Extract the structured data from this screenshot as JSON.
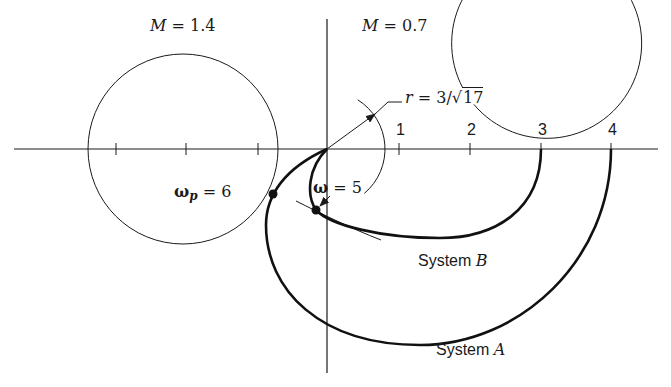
{
  "figure": {
    "width": 671,
    "height": 387,
    "ink_color": "#1a1a1a",
    "background": "#ffffff",
    "origin_px": [
      327,
      149
    ],
    "px_per_unit": 71
  },
  "axes": {
    "real_axis": {
      "x1": 14,
      "x2": 658,
      "y": 149
    },
    "imag_axis": {
      "x": 327,
      "y1": 19,
      "y2": 373
    },
    "ticks_negative_px": [
      116,
      186,
      258
    ],
    "ticks_positive": [
      {
        "label": "1",
        "x": 399
      },
      {
        "label": "2",
        "x": 470
      },
      {
        "label": "3",
        "x": 541
      },
      {
        "label": "4",
        "x": 611
      }
    ]
  },
  "m_circles": [
    {
      "name": "M = 1.4",
      "label_M": "M",
      "label_eq": " = ",
      "label_val": "1.4",
      "cx": 183,
      "cy": 149,
      "r": 95,
      "label_x": 150,
      "label_y": 18
    },
    {
      "name": "M = 0.7",
      "label_M": "M",
      "label_eq": " = ",
      "label_val": "0.7",
      "cx": 390,
      "cy": 149,
      "r": 95,
      "label_x": 362,
      "label_y": 18
    }
  ],
  "radius_annotation": {
    "prefix": "r",
    "eq": " = ",
    "num": "3/",
    "sqrt_arg": "17",
    "arrow_to": [
      375,
      114
    ],
    "leader_end": [
      402,
      102
    ],
    "label_x": 405,
    "label_y": 90,
    "arc_r": 58
  },
  "curves": {
    "system_A": {
      "label_prefix": "System ",
      "label_name": "A",
      "label_x": 436,
      "label_y": 342,
      "start_real": 4,
      "path": "M 611 149 C 611 260, 520 345, 420 345 C 320 345, 266 290, 266 225 C 266 195, 285 168, 327 149"
    },
    "system_B": {
      "label_prefix": "System ",
      "label_name": "B",
      "label_x": 418,
      "label_y": 253,
      "start_real": 3,
      "path": "M 541 149 C 541 210, 495 238, 440 238 C 380 238, 330 225, 316 210 C 306 195, 308 168, 327 149"
    }
  },
  "points": {
    "omega_p": {
      "symbol": "ω",
      "subscript": "p",
      "eq": " = ",
      "value": "6",
      "x": 273,
      "y": 194,
      "label_x": 174,
      "label_y": 184
    },
    "omega_5": {
      "symbol": "ω",
      "eq": " = ",
      "value": "5",
      "x": 316,
      "y": 210,
      "label_x": 313,
      "label_y": 180
    }
  },
  "tangent_arc": {
    "path": "M 296 201 C 320 213, 350 228, 381 240"
  }
}
